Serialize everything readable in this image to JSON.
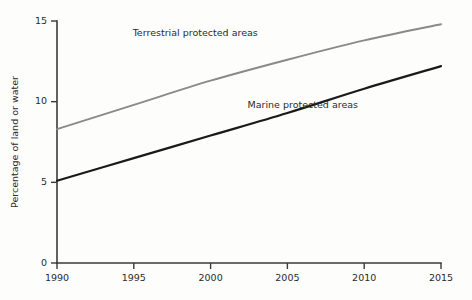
{
  "chart_data": {
    "type": "line",
    "title": "",
    "xlabel": "",
    "ylabel": "Percentage of land or water",
    "xlim": [
      1990,
      2015
    ],
    "ylim": [
      0,
      15
    ],
    "grid": false,
    "legend_position": "inline-annotation",
    "x": [
      1990,
      1995,
      2000,
      2005,
      2010,
      2015
    ],
    "xticks": [
      "1990",
      "1995",
      "2000",
      "2005",
      "2010",
      "2015"
    ],
    "yticks": [
      "0",
      "5",
      "10",
      "15"
    ],
    "ytick_values": [
      0,
      5,
      10,
      15
    ],
    "series": [
      {
        "name": "Terrestrial protected areas",
        "color": "#8a8a8a",
        "values": [
          8.3,
          9.8,
          11.3,
          12.6,
          13.8,
          14.8
        ]
      },
      {
        "name": "Marine protected areas",
        "color": "#1a1a1a",
        "values": [
          5.1,
          6.5,
          7.9,
          9.3,
          10.8,
          12.2
        ]
      }
    ],
    "annotations": [
      {
        "text": "Terrestrial protected areas",
        "x": 1999.0,
        "y": 14.1
      },
      {
        "text": "Marine protected areas",
        "x": 2006.0,
        "y": 9.6
      }
    ]
  }
}
